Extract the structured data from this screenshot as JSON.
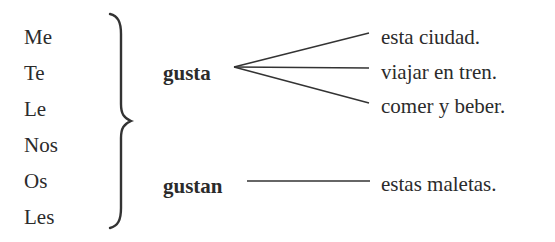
{
  "pronouns": [
    "Me",
    "Te",
    "Le",
    "Nos",
    "Os",
    "Les"
  ],
  "verbs": {
    "singular": "gusta",
    "plural": "gustan"
  },
  "complements": {
    "singular": [
      "esta ciudad.",
      "viajar en tren.",
      "comer y beber."
    ],
    "plural": [
      "estas maletas."
    ]
  },
  "colors": {
    "text": "#2b2b2b",
    "lines": "#333333"
  }
}
